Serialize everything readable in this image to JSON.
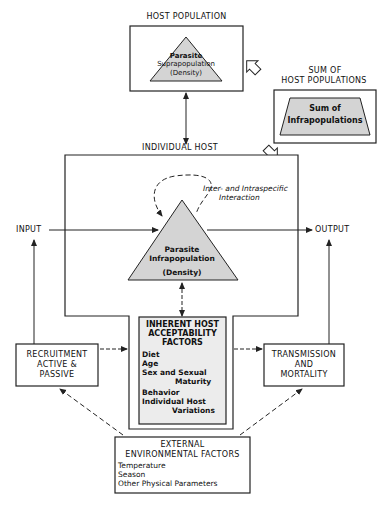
{
  "diagram": {
    "host_population": {
      "title": "HOST POPULATION",
      "triangle_line1": "Parasite",
      "triangle_line2": "Suprapopulation",
      "triangle_line3": "(Density)"
    },
    "sum_host_populations": {
      "title_line1": "SUM OF",
      "title_line2": "HOST POPULATIONS",
      "trapezoid_line1": "Sum of",
      "trapezoid_line2": "Infrapopulations"
    },
    "individual_host": {
      "title": "INDIVIDUAL HOST",
      "interaction_line1": "Inter- and Intraspecific",
      "interaction_line2": "Interaction",
      "triangle_line1": "Parasite",
      "triangle_line2": "Infrapopulation",
      "triangle_line3": "(Density)"
    },
    "flow": {
      "input": "INPUT",
      "output": "OUTPUT"
    },
    "inherent_factors": {
      "title_line1": "INHERENT HOST",
      "title_line2": "ACCEPTABILITY",
      "title_line3": "FACTORS",
      "items": [
        "Diet",
        "Age",
        "Sex and Sexual",
        "Maturity",
        "Behavior",
        "Individual Host",
        "Variations"
      ]
    },
    "recruitment": {
      "line1": "RECRUITMENT",
      "line2": "ACTIVE &",
      "line3": "PASSIVE"
    },
    "transmission": {
      "line1": "TRANSMISSION",
      "line2": "AND",
      "line3": "MORTALITY"
    },
    "external_factors": {
      "title_line1": "EXTERNAL",
      "title_line2": "ENVIRONMENTAL FACTORS",
      "items": [
        "Temperature",
        "Season",
        "Other Physical Parameters"
      ]
    },
    "colors": {
      "shape_fill": "#d4d4d4",
      "line": "#222222",
      "background": "#ffffff"
    }
  }
}
